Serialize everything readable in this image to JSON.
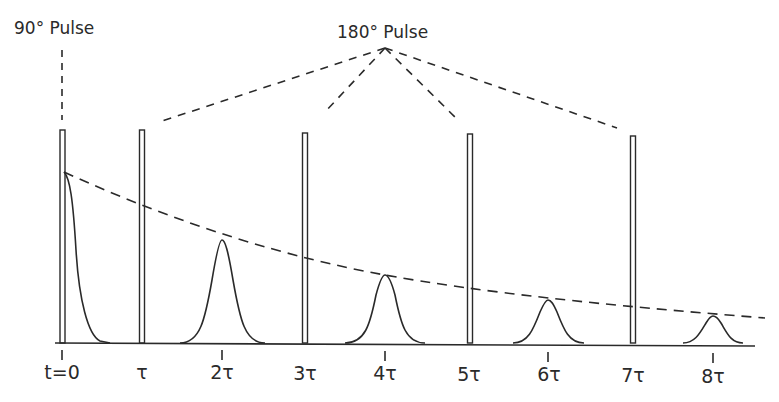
{
  "diagram": {
    "labels": {
      "pulse_90": "90° Pulse",
      "pulse_180": "180° Pulse"
    },
    "time_axis": {
      "ticks": [
        {
          "label": "t=0",
          "x": 62
        },
        {
          "label": "τ",
          "x": 142
        },
        {
          "label": "2τ",
          "x": 222
        },
        {
          "label": "3τ",
          "x": 305
        },
        {
          "label": "4τ",
          "x": 385
        },
        {
          "label": "5τ",
          "x": 470
        },
        {
          "label": "6τ",
          "x": 548
        },
        {
          "label": "7τ",
          "x": 633
        },
        {
          "label": "8τ",
          "x": 713
        }
      ],
      "baseline_y": 343
    },
    "pulses": [
      {
        "type": "90°",
        "time": "t=0",
        "x": 62,
        "top": 130
      },
      {
        "type": "180°",
        "time": "τ",
        "x": 142,
        "top": 130
      },
      {
        "type": "180°",
        "time": "3τ",
        "x": 305,
        "top": 133
      },
      {
        "type": "180°",
        "time": "5τ",
        "x": 470,
        "top": 134
      },
      {
        "type": "180°",
        "time": "7τ",
        "x": 633,
        "top": 136
      }
    ],
    "echoes": [
      {
        "time": "2τ",
        "x": 222,
        "peak_y": 240
      },
      {
        "time": "4τ",
        "x": 385,
        "peak_y": 275
      },
      {
        "time": "6τ",
        "x": 548,
        "peak_y": 300
      },
      {
        "time": "8τ",
        "x": 713,
        "peak_y": 316
      }
    ],
    "fid": {
      "start_x": 63,
      "start_y": 172
    },
    "envelope": {
      "description": "T2 decay envelope (dashed)",
      "start": [
        63,
        172
      ],
      "end": [
        765,
        318
      ]
    },
    "colors": {
      "ink": "#2a2a2a",
      "background": "#ffffff"
    }
  }
}
